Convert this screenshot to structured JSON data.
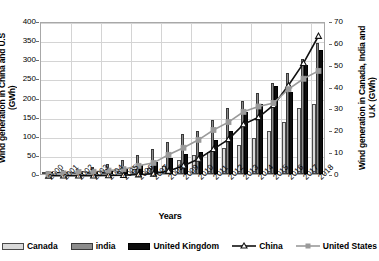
{
  "chart_data": {
    "type": "bar",
    "title": "",
    "xlabel": "Years",
    "ylabel": "Wind generation in China and U.S (GWh)",
    "ylabel_secondary": "Wind generation in Canada, India and U.K (GWh)",
    "categories": [
      "2000",
      "2001",
      "2002",
      "2003",
      "2004",
      "2005",
      "2006",
      "2007",
      "2008",
      "2009",
      "2010",
      "2011",
      "2012",
      "2013",
      "2014",
      "2015",
      "2016",
      "2017",
      "2018"
    ],
    "ylim": [
      0,
      400
    ],
    "yticks": [
      0,
      50,
      100,
      150,
      200,
      250,
      300,
      350,
      400
    ],
    "ylim_secondary": [
      0,
      70
    ],
    "yticks_secondary": [
      0,
      10,
      20,
      30,
      40,
      50,
      60,
      70
    ],
    "grid": true,
    "legend_position": "bottom",
    "series": [
      {
        "name": "Canada",
        "kind": "bar",
        "axis": "secondary",
        "color": "#d9d9d9",
        "values": [
          0.3,
          0.4,
          0.5,
          0.6,
          0.8,
          1.6,
          2.2,
          2.8,
          3.5,
          6.5,
          8.6,
          10.2,
          11.8,
          13.5,
          16.5,
          19.5,
          24.0,
          30.0,
          32.0
        ]
      },
      {
        "name": "india",
        "kind": "bar",
        "axis": "secondary",
        "color": "#8c8c8c",
        "values": [
          1.6,
          2.0,
          2.5,
          3.2,
          4.4,
          6.3,
          8.5,
          11.5,
          14.7,
          18.5,
          19.7,
          24.5,
          30.0,
          33.5,
          37.0,
          41.5,
          46.0,
          52.5,
          60.0
        ]
      },
      {
        "name": "United Kingdom",
        "kind": "bar",
        "axis": "secondary",
        "color": "#0d0d0d",
        "values": [
          0.9,
          1.0,
          1.3,
          1.3,
          1.9,
          2.9,
          4.2,
          5.3,
          7.1,
          9.3,
          10.2,
          15.5,
          19.6,
          28.4,
          32.0,
          40.3,
          37.4,
          50.0,
          56.9
        ]
      },
      {
        "name": "China",
        "kind": "line",
        "axis": "secondary",
        "color": "#111111",
        "marker": "triangle",
        "values": [
          0.6,
          0.7,
          0.8,
          1.0,
          1.3,
          2.0,
          3.9,
          5.7,
          13.0,
          26.9,
          44.6,
          70.3,
          95.9,
          134.9,
          153.4,
          185.1,
          237.1,
          295.0,
          366.0
        ]
      },
      {
        "name": "United States",
        "kind": "line",
        "axis": "secondary",
        "color": "#9a9a9a",
        "marker": "square",
        "values": [
          5.6,
          6.7,
          10.4,
          11.2,
          14.1,
          17.8,
          26.6,
          34.4,
          55.4,
          73.9,
          94.6,
          120.2,
          140.8,
          167.8,
          181.7,
          190.7,
          226.9,
          254.3,
          274.9
        ]
      }
    ]
  },
  "legend": {
    "items": [
      {
        "label": "Canada"
      },
      {
        "label": "india"
      },
      {
        "label": "United Kingdom"
      },
      {
        "label": "China"
      },
      {
        "label": "United States"
      }
    ]
  }
}
